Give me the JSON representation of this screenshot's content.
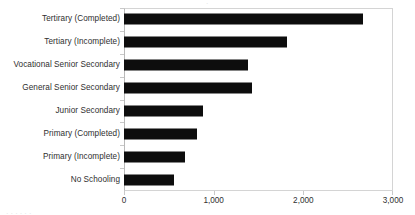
{
  "chart_data": {
    "type": "bar",
    "orientation": "horizontal",
    "title": "",
    "xlabel": "",
    "ylabel": "",
    "xlim": [
      0,
      3000
    ],
    "xticks": [
      "0",
      "1,000",
      "2,000",
      "3,000"
    ],
    "xtick_values": [
      0,
      1000,
      2000,
      3000
    ],
    "grid": false,
    "legend": false,
    "bar_color": "#0d0d0d",
    "axis_color": "#d4d4d4",
    "categories": [
      "Tertirary (Completed)",
      "Tertiary (Incomplete)",
      "Vocational Senior Secondary",
      "General Senior Secondary",
      "Junior Secondary",
      "Primary (Completed)",
      "Primary (Incomplete)",
      "No Schooling"
    ],
    "values": [
      2660,
      1818,
      1383,
      1428,
      880,
      815,
      680,
      558
    ]
  },
  "artifacts": {
    "top_cutoff": "·",
    "bottom_cutoff": "·  ·  ·  ·  ·  ·"
  }
}
